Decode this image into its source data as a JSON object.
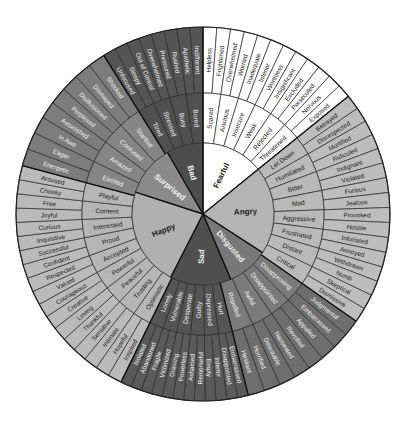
{
  "geometry": {
    "cx": 203,
    "cy": 214,
    "r_core": 71,
    "r_mid": 121,
    "r_outer": 187
  },
  "colors": {
    "stroke": "#2a2a2a",
    "text_dark": "#222222",
    "text_light": "#f2f2f2"
  },
  "sectors": [
    {
      "name": "Fearful",
      "core_start": 0,
      "core_end": 51,
      "start": 0,
      "end": 51,
      "core_fill": "#ffffff",
      "mid_fill": "#ffffff",
      "outer_fill": "#ffffff",
      "text": "dark",
      "children": [
        {
          "name": "Scared",
          "children": [
            "Helpless",
            "Frightened"
          ]
        },
        {
          "name": "Anxious",
          "children": [
            "Overwhelmed",
            "Worried"
          ]
        },
        {
          "name": "Insecure",
          "children": [
            "Inadequate",
            "Inferior"
          ]
        },
        {
          "name": "Weak",
          "children": [
            "Worthless",
            "Insignificant"
          ]
        },
        {
          "name": "Rejected",
          "children": [
            "Excluded",
            "Persecuted"
          ]
        },
        {
          "name": "Threatened",
          "children": [
            "Nervous",
            "Exposed"
          ]
        }
      ]
    },
    {
      "name": "Angry",
      "core_start": 51,
      "core_end": 123,
      "start": 51,
      "end": 125,
      "core_fill": "#b4b4b4",
      "mid_fill": "#b9b9b9",
      "outer_fill": "#bdbdbd",
      "text": "dark",
      "children": [
        {
          "name": "Let Down",
          "children": [
            "Betrayed",
            "Disrespected"
          ]
        },
        {
          "name": "Humiliated",
          "children": [
            "Mortified",
            "Ridiculed"
          ]
        },
        {
          "name": "Bitter",
          "children": [
            "Indignant",
            "Violated"
          ]
        },
        {
          "name": "Mad",
          "children": [
            "Furious",
            "Jealous"
          ]
        },
        {
          "name": "Aggressive",
          "children": [
            "Provoked",
            "Hostile"
          ]
        },
        {
          "name": "Frustrated",
          "children": [
            "Infuriated",
            "Annoyed"
          ]
        },
        {
          "name": "Distant",
          "children": [
            "Withdrawn",
            "Numb"
          ]
        },
        {
          "name": "Critical",
          "children": [
            "Skeptical",
            "Dismissive"
          ]
        }
      ]
    },
    {
      "name": "Disgusted",
      "core_start": 123,
      "core_end": 157,
      "start": 125,
      "end": 166,
      "core_fill": "#787878",
      "mid_fill": "#7b7b7b",
      "outer_fill": "#6e6e6e",
      "text": "light",
      "children": [
        {
          "name": "Disapproving",
          "children": [
            "Judgmental",
            "Embarrassed"
          ]
        },
        {
          "name": "Disappointed",
          "children": [
            "Appalled",
            "Revolted"
          ]
        },
        {
          "name": "Awful",
          "children": [
            "Nauseated",
            "Detestable"
          ]
        },
        {
          "name": "Repelled",
          "children": [
            "Horrified",
            "Hesitant"
          ]
        }
      ]
    },
    {
      "name": "Sad",
      "core_start": 157,
      "core_end": 207,
      "start": 166,
      "end": 206,
      "core_fill": "#4f4f4f",
      "mid_fill": "#555555",
      "outer_fill": "#5a5a5a",
      "text": "light",
      "children": [
        {
          "name": "Hurt",
          "children": [
            "Embarrassed",
            "Disappointed"
          ]
        },
        {
          "name": "Depressed",
          "children": [
            "Inferior",
            "Empty"
          ]
        },
        {
          "name": "Guilty",
          "children": [
            "Remorseful",
            "Ashamed"
          ]
        },
        {
          "name": "Desperate",
          "children": [
            "Powerless",
            "Grieving"
          ]
        },
        {
          "name": "Vulnerable",
          "children": [
            "Victimized",
            "Fragile"
          ]
        },
        {
          "name": "Lonely",
          "children": [
            "Abandoned",
            "Isolated"
          ]
        }
      ]
    },
    {
      "name": "Happy",
      "core_start": 207,
      "core_end": 288,
      "start": 206,
      "end": 285,
      "core_fill": "#b0b0b0",
      "mid_fill": "#b6b6b6",
      "outer_fill": "#bababa",
      "text": "dark",
      "children": [
        {
          "name": "Optimistic",
          "children": [
            "Inspired",
            "Hopeful"
          ]
        },
        {
          "name": "Trusting",
          "children": [
            "Intimate",
            "Sensitive"
          ]
        },
        {
          "name": "Peaceful",
          "children": [
            "Thankful",
            "Loving"
          ]
        },
        {
          "name": "Powerful",
          "children": [
            "Creative",
            "Courageous"
          ]
        },
        {
          "name": "Accepted",
          "children": [
            "Valued",
            "Respected"
          ]
        },
        {
          "name": "Proud",
          "children": [
            "Confident",
            "Successful"
          ]
        },
        {
          "name": "Interested",
          "children": [
            "Inquisitive",
            "Curious"
          ]
        },
        {
          "name": "Content",
          "children": [
            "Joyful",
            "Free"
          ]
        },
        {
          "name": "Playful",
          "children": [
            "Cheeky",
            "Aroused"
          ]
        }
      ]
    },
    {
      "name": "Surprised",
      "core_start": 288,
      "core_end": 330,
      "start": 285,
      "end": 328,
      "core_fill": "#8a8a8a",
      "mid_fill": "#858585",
      "outer_fill": "#7c7c7c",
      "text": "light",
      "children": [
        {
          "name": "Excited",
          "children": [
            "Energetic",
            "Eager"
          ]
        },
        {
          "name": "Amazed",
          "children": [
            "In Awe",
            "Astonished"
          ]
        },
        {
          "name": "Confused",
          "children": [
            "Perplexed",
            "Disillusioned"
          ]
        },
        {
          "name": "Startled",
          "children": [
            "Dismayed",
            "Shocked"
          ]
        }
      ]
    },
    {
      "name": "Bad",
      "core_start": 330,
      "core_end": 360,
      "start": 328,
      "end": 360,
      "core_fill": "#4c4c4c",
      "mid_fill": "#505050",
      "outer_fill": "#555555",
      "text": "light",
      "children": [
        {
          "name": "Tired",
          "children": [
            "Unfocused",
            "Sleepy"
          ]
        },
        {
          "name": "Stressed",
          "children": [
            "Out of Control",
            "Overwhelmed"
          ]
        },
        {
          "name": "Busy",
          "children": [
            "Pressured",
            "Rushed"
          ]
        },
        {
          "name": "Bored",
          "children": [
            "Apathetic",
            "Indifferent"
          ]
        }
      ]
    }
  ]
}
